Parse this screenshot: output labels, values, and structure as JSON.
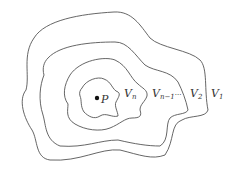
{
  "diagram": {
    "type": "nested-neighborhoods",
    "point": {
      "label": "P",
      "x": 97,
      "y": 98
    },
    "labels": {
      "vn": {
        "base": "V",
        "sub": "n"
      },
      "vn1": {
        "base": "V",
        "sub": "n−1",
        "suffix": "···"
      },
      "v2": {
        "base": "V",
        "sub": "2"
      },
      "v1": {
        "base": "V",
        "sub": "1"
      }
    },
    "colors": {
      "stroke": "#555555",
      "text": "#333333",
      "background": "#ffffff"
    }
  }
}
